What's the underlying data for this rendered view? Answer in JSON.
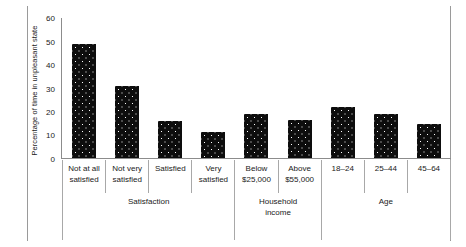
{
  "chart_data": {
    "type": "bar",
    "title": "",
    "xlabel": "",
    "ylabel": "Percentage of time in unpleasant state",
    "ylim": [
      0,
      60
    ],
    "yticks": [
      "0",
      "10",
      "20",
      "30",
      "40",
      "50",
      "60"
    ],
    "grid": false,
    "legend": "none",
    "categories": [
      "Not at all satisfied",
      "Not very satisfied",
      "Satisfied",
      "Very satisfied",
      "Below $25,000",
      "Above $55,000",
      "18–24",
      "25–44",
      "45–64"
    ],
    "values": [
      49,
      31,
      16,
      11,
      19,
      16.5,
      22,
      19,
      14.5
    ],
    "group_labels": [
      "Satisfaction",
      "Household income",
      "Age"
    ],
    "groups": [
      {
        "label": "Satisfaction",
        "span": 4
      },
      {
        "label": "Household\nincome",
        "span": 2
      },
      {
        "label": "Age",
        "span": 3
      }
    ],
    "bar_color": "#0d0d0d",
    "bar_pattern": "white-dots",
    "axis_color": "#8c8c8c"
  },
  "axis": {
    "y_label": "Percentage of time in unpleasant state",
    "ticks": [
      "60",
      "50",
      "40",
      "30",
      "20",
      "10",
      "0"
    ]
  },
  "category_labels": [
    "Not at all\nsatisfied",
    "Not very\nsatisfied",
    "Satisfied",
    "Very\nsatisfied",
    "Below\n$25,000",
    "Above\n$55,000",
    "18–24",
    "25–44",
    "45–64"
  ],
  "group_row": [
    "Satisfaction",
    "Household\nincome",
    "Age"
  ]
}
